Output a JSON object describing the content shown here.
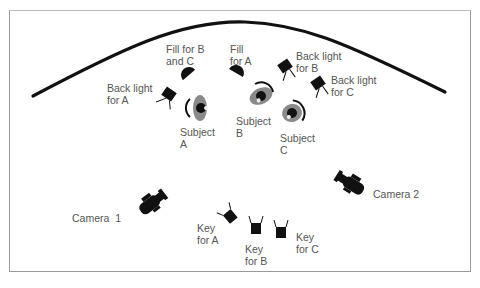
{
  "diagram": {
    "background_arc": "cyclorama",
    "labels": {
      "fill_bc": "Fill for B\nand C",
      "fill_a": "Fill\nfor A",
      "back_b": "Back light\nfor B",
      "back_c": "Back light\nfor C",
      "back_a": "Back light\nfor A",
      "subject_a": "Subject\nA",
      "subject_b": "Subject\nB",
      "subject_c": "Subject\nC",
      "camera_1": "Camera  1",
      "camera_2": "Camera 2",
      "key_a": "Key\nfor A",
      "key_b": "Key\nfor B",
      "key_c": "Key\nfor C"
    },
    "colors": {
      "ink": "#111111",
      "label": "#555555",
      "border": "#9a9a9a",
      "subject_body": "#8a8a8a"
    }
  }
}
